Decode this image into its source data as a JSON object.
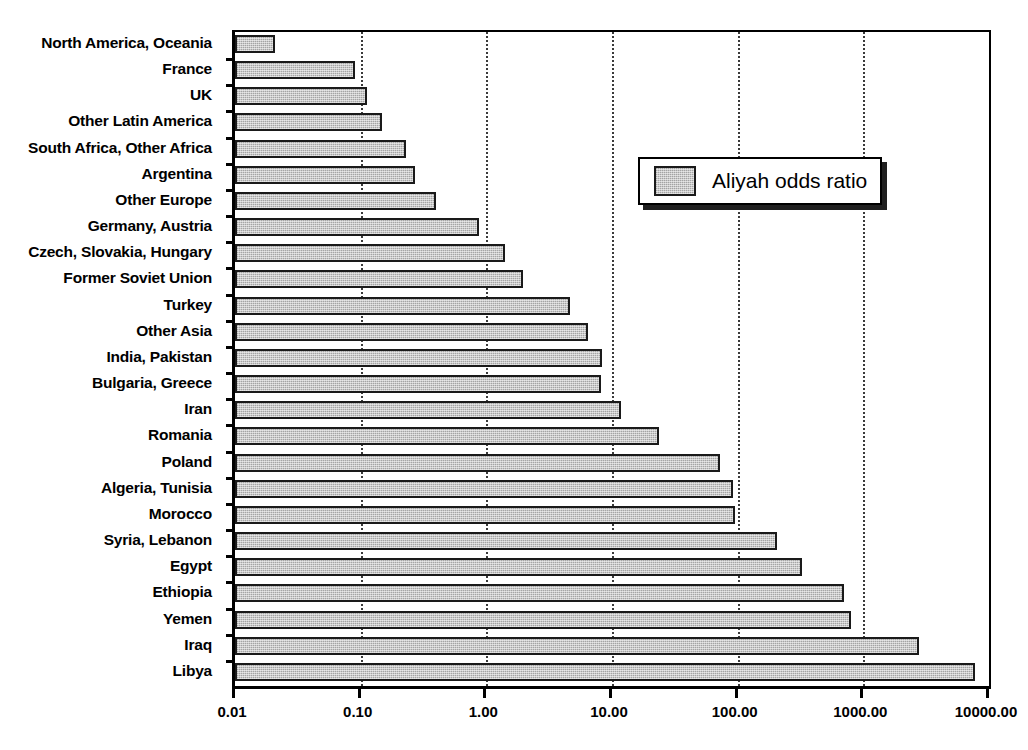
{
  "chart_data": {
    "type": "bar",
    "orientation": "horizontal",
    "title": "",
    "xlabel": "",
    "ylabel": "",
    "xscale": "log",
    "xlim": [
      0.01,
      10000
    ],
    "xticks": [
      0.01,
      0.1,
      1.0,
      10.0,
      100.0,
      1000.0,
      10000.0
    ],
    "xticklabels": [
      "0.01",
      "0.10",
      "1.00",
      "10.00",
      "100.00",
      "1000.00",
      "10000.00"
    ],
    "grid": "vertical-dotted",
    "legend": {
      "position": "upper-right-inside",
      "entries": [
        "Aliyah odds ratio"
      ]
    },
    "series": [
      {
        "name": "Aliyah odds ratio",
        "color": "#c9c9c9",
        "edgecolor": "#1a1a1a"
      }
    ],
    "categories": [
      "North America, Oceania",
      "France",
      "UK",
      "Other Latin America",
      "South Africa, Other Africa",
      "Argentina",
      "Other Europe",
      "Germany, Austria",
      "Czech, Slovakia, Hungary",
      "Former Soviet Union",
      "Turkey",
      "Other Asia",
      "India, Pakistan",
      "Bulgaria, Greece",
      "Iran",
      "Romania",
      "Poland",
      "Algeria, Tunisia",
      "Morocco",
      "Syria, Lebanon",
      "Egypt",
      "Ethiopia",
      "Yemen",
      "Iraq",
      "Libya"
    ],
    "values": [
      0.021,
      0.09,
      0.112,
      0.148,
      0.23,
      0.27,
      0.4,
      0.87,
      1.4,
      1.95,
      4.6,
      6.5,
      8.3,
      8.2,
      11.8,
      23.6,
      72,
      92,
      95,
      205,
      325,
      700,
      800,
      2750,
      7800
    ]
  }
}
